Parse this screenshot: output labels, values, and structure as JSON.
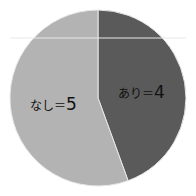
{
  "chart_data": {
    "type": "pie",
    "title": "",
    "start": "top",
    "direction": "clockwise",
    "slices": [
      {
        "label": "あり",
        "value": 4,
        "display": "あり＝4",
        "color": "#5a5a5a"
      },
      {
        "label": "なし",
        "value": 5,
        "display": "なし＝5",
        "color": "#b3b3b3"
      }
    ],
    "separator_color": "#e8e8e8"
  }
}
